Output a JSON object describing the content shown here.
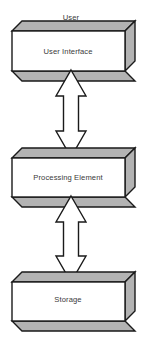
{
  "diagram": {
    "type": "block-diagram",
    "title": "User",
    "orientation": "vertical",
    "caption": {
      "text": "User",
      "x": 71,
      "y": 18
    },
    "colors": {
      "front_face": "#ffffff",
      "side_face": "#b3b3b3",
      "outline": "#1a1a1a",
      "text": "#3a3a3a",
      "background": "#ffffff"
    },
    "nodes": [
      {
        "id": "user-interface",
        "label": "User Interface",
        "shape": "3d-box",
        "front": {
          "x": 12,
          "y": 31,
          "width": 113,
          "height": 40
        },
        "depth": {
          "dx": 10,
          "dy": -10
        },
        "label_x": 68,
        "label_y": 51
      },
      {
        "id": "processing-element",
        "label": "Processing Element",
        "shape": "3d-box",
        "front": {
          "x": 12,
          "y": 158,
          "width": 113,
          "height": 39
        },
        "depth": {
          "dx": 10,
          "dy": -10
        },
        "label_x": 68,
        "label_y": 177
      },
      {
        "id": "storage",
        "label": "Storage",
        "shape": "3d-box",
        "front": {
          "x": 12,
          "y": 282,
          "width": 113,
          "height": 39
        },
        "depth": {
          "dx": 10,
          "dy": -10
        },
        "label_x": 68,
        "label_y": 299
      }
    ],
    "connectors": [
      {
        "id": "ui-to-pe",
        "from": "user-interface",
        "to": "processing-element",
        "style": "double-headed-arrow",
        "direction": "bidirectional",
        "center_x": 71,
        "top_y": 70,
        "bottom_y": 157,
        "head_half_width": 15,
        "shaft_half_width": 7.5,
        "head_length": 26
      },
      {
        "id": "pe-to-storage",
        "from": "processing-element",
        "to": "storage",
        "style": "double-headed-arrow",
        "direction": "bidirectional",
        "center_x": 71,
        "top_y": 196,
        "bottom_y": 282,
        "head_half_width": 15,
        "shaft_half_width": 7.5,
        "head_length": 26
      }
    ]
  }
}
